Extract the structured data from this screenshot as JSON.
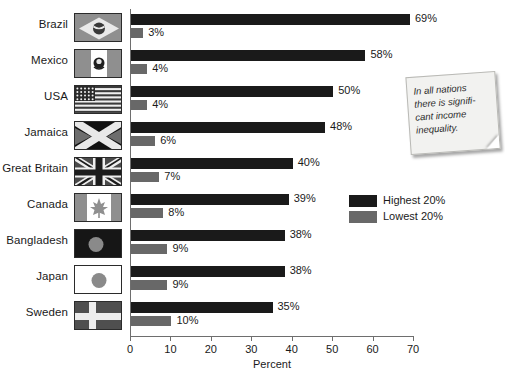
{
  "chart_data": {
    "type": "bar",
    "title": "",
    "xlabel": "Percent",
    "ylabel": "",
    "xlim": [
      0,
      70
    ],
    "orientation": "horizontal",
    "grid": false,
    "legend_position": "middle-right",
    "categories": [
      "Brazil",
      "Mexico",
      "USA",
      "Jamaica",
      "Great Britain",
      "Canada",
      "Bangladesh",
      "Japan",
      "Sweden"
    ],
    "series": [
      {
        "name": "Highest 20%",
        "color": "#1a1a1a",
        "values": [
          69,
          58,
          50,
          48,
          40,
          39,
          38,
          38,
          35
        ]
      },
      {
        "name": "Lowest 20%",
        "color": "#686868",
        "values": [
          3,
          4,
          4,
          6,
          7,
          8,
          9,
          9,
          10
        ]
      }
    ],
    "value_labels": {
      "highest": [
        "69%",
        "58%",
        "50%",
        "48%",
        "40%",
        "39%",
        "38%",
        "38%",
        "35%"
      ],
      "lowest": [
        "3%",
        "4%",
        "4%",
        "6%",
        "7%",
        "8%",
        "9%",
        "9%",
        "10%"
      ]
    },
    "xticks": [
      0,
      10,
      20,
      30,
      40,
      50,
      60,
      70
    ],
    "xtick_labels": [
      "0",
      "10",
      "20",
      "30",
      "40",
      "50",
      "60",
      "70"
    ]
  },
  "rows": [
    {
      "country": "Brazil",
      "flag": "flag-brazil",
      "high_label": "69%",
      "low_label": "3%"
    },
    {
      "country": "Mexico",
      "flag": "flag-mexico",
      "high_label": "58%",
      "low_label": "4%"
    },
    {
      "country": "USA",
      "flag": "flag-usa",
      "high_label": "50%",
      "low_label": "4%"
    },
    {
      "country": "Jamaica",
      "flag": "flag-jamaica",
      "high_label": "48%",
      "low_label": "6%"
    },
    {
      "country": "Great Britain",
      "flag": "flag-great-britain",
      "high_label": "40%",
      "low_label": "7%"
    },
    {
      "country": "Canada",
      "flag": "flag-canada",
      "high_label": "39%",
      "low_label": "8%"
    },
    {
      "country": "Bangladesh",
      "flag": "flag-bangladesh",
      "high_label": "38%",
      "low_label": "9%"
    },
    {
      "country": "Japan",
      "flag": "flag-japan",
      "high_label": "38%",
      "low_label": "9%"
    },
    {
      "country": "Sweden",
      "flag": "flag-sweden",
      "high_label": "35%",
      "low_label": "10%"
    }
  ],
  "legend": {
    "items": [
      {
        "label": "Highest 20%",
        "color": "#1a1a1a"
      },
      {
        "label": "Lowest 20%",
        "color": "#686868"
      }
    ]
  },
  "axis": {
    "title": "Percent",
    "ticks": [
      "0",
      "10",
      "20",
      "30",
      "40",
      "50",
      "60",
      "70"
    ]
  },
  "note": {
    "text": "In all nations there is signifi-cant income inequality."
  }
}
